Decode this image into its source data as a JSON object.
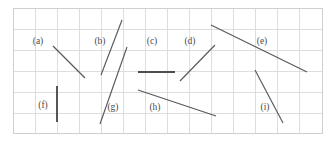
{
  "figure": {
    "width": 333,
    "height": 142,
    "background_color": "#ffffff"
  },
  "grid": {
    "line_color": "#d6d6d6",
    "border_color": "#cfcfcf",
    "x_left": 13,
    "x_right": 322,
    "y_top": 8,
    "y_bottom": 133,
    "cell_size": 21,
    "columns": 14,
    "rows": 6,
    "vertical_lines": [
      13,
      35,
      57,
      79,
      101,
      123,
      145,
      167,
      189,
      211,
      233,
      255,
      277,
      299,
      322
    ],
    "horizontal_lines": [
      8,
      29,
      50,
      71,
      92,
      113,
      133
    ]
  },
  "segments": [
    {
      "id": "a",
      "label": "(a)",
      "label_x": 38,
      "label_y": 42,
      "x1": 53,
      "y1": 46,
      "x2": 85,
      "y2": 78,
      "color": "#555a5e",
      "weight": "normal"
    },
    {
      "id": "b",
      "label": "(b)",
      "label_x": 100,
      "label_y": 42,
      "x1": 101,
      "y1": 75,
      "x2": 122,
      "y2": 20,
      "color": "#555a5e",
      "weight": "normal"
    },
    {
      "id": "c",
      "label": "(c)",
      "label_x": 152,
      "label_y": 42,
      "x1": 138,
      "y1": 72,
      "x2": 175,
      "y2": 72,
      "color": "#4a4f53",
      "weight": "thick"
    },
    {
      "id": "d",
      "label": "(d)",
      "label_x": 190,
      "label_y": 42,
      "x1": 180,
      "y1": 81,
      "x2": 215,
      "y2": 45,
      "color": "#555a5e",
      "weight": "normal"
    },
    {
      "id": "e",
      "label": "(e)",
      "label_x": 262,
      "label_y": 42,
      "x1": 211,
      "y1": 25,
      "x2": 307,
      "y2": 72,
      "color": "#555a5e",
      "weight": "normal"
    },
    {
      "id": "f",
      "label": "(f)",
      "label_x": 43,
      "label_y": 106,
      "x1": 57,
      "y1": 86,
      "x2": 57,
      "y2": 122,
      "color": "#555a5e",
      "weight": "thick"
    },
    {
      "id": "g",
      "label": "(g)",
      "label_x": 113,
      "label_y": 108,
      "x1": 100,
      "y1": 124,
      "x2": 127,
      "y2": 47,
      "color": "#555a5e",
      "weight": "normal"
    },
    {
      "id": "h",
      "label": "(h)",
      "label_x": 155,
      "label_y": 108,
      "x1": 138,
      "y1": 90,
      "x2": 216,
      "y2": 116,
      "color": "#555a5e",
      "weight": "normal"
    },
    {
      "id": "i",
      "label": "(i)",
      "label_x": 265,
      "label_y": 108,
      "x1": 255,
      "y1": 70,
      "x2": 283,
      "y2": 123,
      "color": "#555a5e",
      "weight": "normal"
    }
  ]
}
